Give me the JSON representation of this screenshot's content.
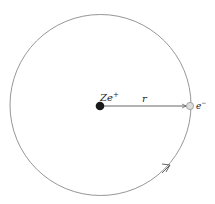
{
  "diagram": {
    "nucleus": {
      "label": "Ze",
      "charge_sup": "+",
      "color": "#1a1a1a"
    },
    "electron": {
      "label": "e",
      "charge_sup": "−",
      "color": "#dddddd"
    },
    "radius_label": "r",
    "orbit_color": "#8a8a8a",
    "arrow_direction": "counterclockwise"
  }
}
